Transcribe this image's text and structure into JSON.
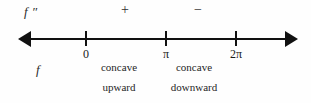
{
  "figure": {
    "type": "sign-chart-number-line",
    "row_labels": {
      "second_derivative": "f ″",
      "function": "f"
    },
    "signs": [
      {
        "symbol": "+",
        "interval": "0 to π"
      },
      {
        "symbol": "−",
        "interval": "π to 2π"
      }
    ],
    "axis": {
      "ticks": [
        {
          "label": "0",
          "x": 85
        },
        {
          "label": "π",
          "x": 165
        },
        {
          "label": "2π",
          "x": 235
        }
      ],
      "left_arrow": "arrow-left",
      "right_arrow": "arrow-right"
    },
    "concavity": [
      {
        "line1": "concave",
        "line2": "upward"
      },
      {
        "line1": "concave",
        "line2": "downward"
      }
    ],
    "colors": {
      "ink": "#111111",
      "text": "#1a1a1a",
      "background": "#fefefe"
    }
  }
}
